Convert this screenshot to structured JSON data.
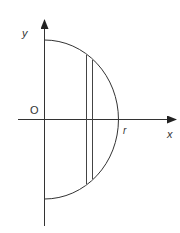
{
  "diagram": {
    "labels": {
      "y_axis": "y",
      "x_axis": "x",
      "origin": "O",
      "radius": "r"
    },
    "colors": {
      "stroke": "#333333",
      "background": "#ffffff"
    }
  }
}
